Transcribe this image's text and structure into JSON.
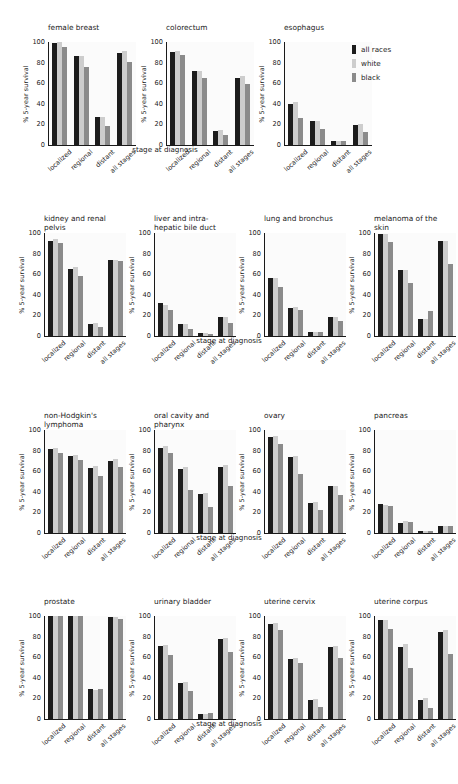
{
  "figure": {
    "x_axis_title": "stage at diagnosis",
    "y_axis_title": "% 5-year survival",
    "y_ticks": [
      "0",
      "20",
      "40",
      "60",
      "80",
      "100"
    ],
    "x_tick_labels": [
      "localized",
      "regional",
      "distant",
      "all stages"
    ]
  },
  "legend": {
    "items": [
      {
        "label": "all races",
        "color": "#1c1c1c"
      },
      {
        "label": "white",
        "color": "#cdcdcd"
      },
      {
        "label": "black",
        "color": "#8b8b8b"
      }
    ]
  },
  "chart_data": {
    "type": "bar",
    "title": "",
    "xlabel": "stage at diagnosis",
    "ylabel": "% 5-year survival",
    "ylim": [
      0,
      100
    ],
    "grid": false,
    "legend_position": "top-right",
    "categories": [
      "localized",
      "regional",
      "distant",
      "all stages"
    ],
    "series_names": [
      "all races",
      "white",
      "black"
    ],
    "panels": [
      {
        "title": "female breast",
        "series": [
          {
            "name": "all races",
            "values": [
              99,
              86,
              27,
              89
            ]
          },
          {
            "name": "white",
            "values": [
              100,
              86,
              27,
              91
            ]
          },
          {
            "name": "black",
            "values": [
              95,
              76,
              18,
              81
            ]
          }
        ]
      },
      {
        "title": "colorectum",
        "series": [
          {
            "name": "all races",
            "values": [
              90,
              72,
              14,
              65
            ]
          },
          {
            "name": "white",
            "values": [
              91,
              72,
              15,
              67
            ]
          },
          {
            "name": "black",
            "values": [
              87,
              65,
              10,
              59
            ]
          }
        ]
      },
      {
        "title": "esophagus",
        "series": [
          {
            "name": "all races",
            "values": [
              40,
              23,
              4,
              19
            ]
          },
          {
            "name": "white",
            "values": [
              42,
              23,
              4,
              20
            ]
          },
          {
            "name": "black",
            "values": [
              26,
              16,
              4,
              13
            ]
          }
        ]
      },
      {
        "title": "kidney and renal\npelvis",
        "series": [
          {
            "name": "all races",
            "values": [
              92,
              65,
              12,
              74
            ]
          },
          {
            "name": "white",
            "values": [
              94,
              67,
              13,
              74
            ]
          },
          {
            "name": "black",
            "values": [
              90,
              58,
              9,
              73
            ]
          }
        ]
      },
      {
        "title": "liver and intra-\nhepatic bile duct",
        "series": [
          {
            "name": "all races",
            "values": [
              32,
              12,
              3,
              18
            ]
          },
          {
            "name": "white",
            "values": [
              30,
              12,
              3,
              18
            ]
          },
          {
            "name": "black",
            "values": [
              25,
              7,
              2,
              13
            ]
          }
        ]
      },
      {
        "title": "lung and bronchus",
        "series": [
          {
            "name": "all races",
            "values": [
              56,
              27,
              4,
              18
            ]
          },
          {
            "name": "white",
            "values": [
              56,
              28,
              4,
              18
            ]
          },
          {
            "name": "black",
            "values": [
              48,
              25,
              4,
              15
            ]
          }
        ]
      },
      {
        "title": "melanoma of the\nskin",
        "series": [
          {
            "name": "all races",
            "values": [
              99,
              64,
              17,
              92
            ]
          },
          {
            "name": "white",
            "values": [
              99,
              64,
              17,
              92
            ]
          },
          {
            "name": "black",
            "values": [
              91,
              51,
              24,
              70
            ]
          }
        ]
      },
      {
        "title": "non-Hodgkin's\nlymphoma",
        "series": [
          {
            "name": "all races",
            "values": [
              82,
              75,
              63,
              70
            ]
          },
          {
            "name": "white",
            "values": [
              83,
              76,
              65,
              72
            ]
          },
          {
            "name": "black",
            "values": [
              78,
              71,
              55,
              64
            ]
          }
        ]
      },
      {
        "title": "oral cavity and\npharynx",
        "series": [
          {
            "name": "all races",
            "values": [
              83,
              62,
              38,
              64
            ]
          },
          {
            "name": "white",
            "values": [
              84,
              64,
              39,
              66
            ]
          },
          {
            "name": "black",
            "values": [
              78,
              42,
              25,
              46
            ]
          }
        ]
      },
      {
        "title": "ovary",
        "series": [
          {
            "name": "all races",
            "values": [
              93,
              74,
              29,
              46
            ]
          },
          {
            "name": "white",
            "values": [
              94,
              75,
              30,
              46
            ]
          },
          {
            "name": "black",
            "values": [
              86,
              57,
              22,
              37
            ]
          }
        ]
      },
      {
        "title": "pancreas",
        "series": [
          {
            "name": "all races",
            "values": [
              28,
              10,
              2,
              7
            ]
          },
          {
            "name": "white",
            "values": [
              27,
              12,
              2,
              7
            ]
          },
          {
            "name": "black",
            "values": [
              26,
              11,
              2,
              7
            ]
          }
        ]
      },
      {
        "title": "prostate",
        "series": [
          {
            "name": "all races",
            "values": [
              100,
              100,
              29,
              99
            ]
          },
          {
            "name": "white",
            "values": [
              100,
              100,
              28,
              99
            ]
          },
          {
            "name": "black",
            "values": [
              100,
              100,
              29,
              97
            ]
          }
        ]
      },
      {
        "title": "urinary bladder",
        "series": [
          {
            "name": "all races",
            "values": [
              71,
              35,
              5,
              78
            ]
          },
          {
            "name": "white",
            "values": [
              72,
              36,
              5,
              79
            ]
          },
          {
            "name": "black",
            "values": [
              62,
              27,
              6,
              65
            ]
          }
        ]
      },
      {
        "title": "uterine cervix",
        "series": [
          {
            "name": "all races",
            "values": [
              92,
              58,
              18,
              70
            ]
          },
          {
            "name": "white",
            "values": [
              93,
              59,
              19,
              71
            ]
          },
          {
            "name": "black",
            "values": [
              86,
              54,
              12,
              59
            ]
          }
        ]
      },
      {
        "title": "uterine corpus",
        "series": [
          {
            "name": "all races",
            "values": [
              96,
              70,
              18,
              84
            ]
          },
          {
            "name": "white",
            "values": [
              96,
              73,
              20,
              86
            ]
          },
          {
            "name": "black",
            "values": [
              87,
              50,
              11,
              63
            ]
          }
        ]
      }
    ]
  },
  "layout": {
    "rows": [
      {
        "panel_indices": [
          0,
          1,
          2
        ],
        "has_legend": true
      },
      {
        "panel_indices": [
          3,
          4,
          5,
          6
        ],
        "has_legend": false
      },
      {
        "panel_indices": [
          7,
          8,
          9,
          10
        ],
        "has_legend": false
      },
      {
        "panel_indices": [
          11,
          12,
          13,
          14
        ],
        "has_legend": false
      }
    ]
  }
}
